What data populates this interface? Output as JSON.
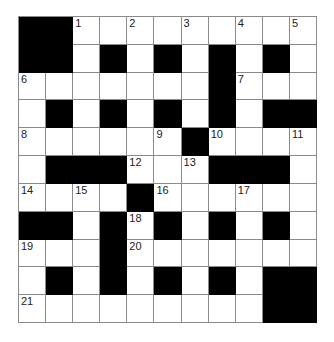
{
  "puzzle": {
    "rows": 11,
    "cols": 11,
    "grid": [
      "##.........",
      "##.#.#.#.#.",
      ".......#...",
      ".#.#.#.#.##",
      "......#....",
      ".###...###.",
      "....#......",
      "##.#.#.#.#.",
      "...#.......",
      ".#.#.#.#.##",
      ".........##"
    ],
    "numbers": [
      {
        "row": 0,
        "col": 2,
        "n": "1"
      },
      {
        "row": 0,
        "col": 4,
        "n": "2"
      },
      {
        "row": 0,
        "col": 6,
        "n": "3"
      },
      {
        "row": 0,
        "col": 8,
        "n": "4"
      },
      {
        "row": 0,
        "col": 10,
        "n": "5"
      },
      {
        "row": 2,
        "col": 0,
        "n": "6"
      },
      {
        "row": 2,
        "col": 8,
        "n": "7"
      },
      {
        "row": 4,
        "col": 0,
        "n": "8"
      },
      {
        "row": 4,
        "col": 5,
        "n": "9"
      },
      {
        "row": 4,
        "col": 7,
        "n": "10"
      },
      {
        "row": 4,
        "col": 10,
        "n": "11"
      },
      {
        "row": 5,
        "col": 4,
        "n": "12"
      },
      {
        "row": 5,
        "col": 6,
        "n": "13"
      },
      {
        "row": 6,
        "col": 0,
        "n": "14"
      },
      {
        "row": 6,
        "col": 2,
        "n": "15"
      },
      {
        "row": 6,
        "col": 5,
        "n": "16"
      },
      {
        "row": 6,
        "col": 8,
        "n": "17"
      },
      {
        "row": 7,
        "col": 4,
        "n": "18"
      },
      {
        "row": 8,
        "col": 0,
        "n": "19"
      },
      {
        "row": 8,
        "col": 4,
        "n": "20"
      },
      {
        "row": 10,
        "col": 0,
        "n": "21"
      }
    ],
    "colors": {
      "block": "#000000",
      "cell": "#ffffff",
      "gridline": "#8a8a8a",
      "number": "#222222"
    }
  }
}
